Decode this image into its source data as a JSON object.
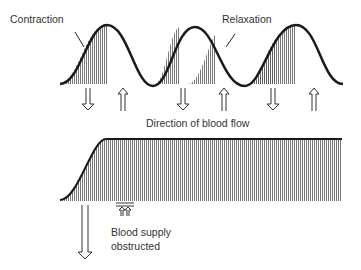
{
  "labels": {
    "contraction": "Contraction",
    "relaxation": "Relaxation",
    "direction": "Direction of blood flow",
    "blood_supply_1": "Blood supply",
    "blood_supply_2": "obstructed"
  },
  "colors": {
    "curve": "#1a1a1a",
    "hatch": "#555555",
    "text": "#333333"
  }
}
